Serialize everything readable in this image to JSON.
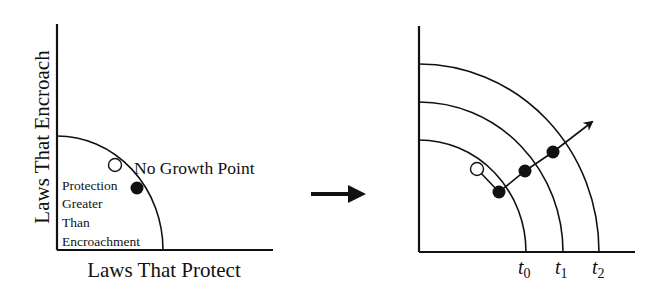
{
  "left_panel": {
    "y_axis_label": "Laws That Encroach",
    "x_axis_label": "Laws That Protect",
    "point_label": "No Growth Point",
    "region_label_lines": [
      "Protection",
      "Greater",
      "Than",
      "Encroachment"
    ],
    "points": [
      {
        "type": "open",
        "name": "no-growth-point"
      },
      {
        "type": "filled",
        "name": "protection-greater-point"
      }
    ]
  },
  "transition_arrow": {
    "direction": "right"
  },
  "right_panel": {
    "curve_labels": [
      {
        "base": "t",
        "sub": "0"
      },
      {
        "base": "t",
        "sub": "1"
      },
      {
        "base": "t",
        "sub": "2"
      }
    ],
    "points": [
      {
        "type": "open"
      },
      {
        "type": "filled",
        "curve": "t0"
      },
      {
        "type": "filled",
        "curve": "t1"
      },
      {
        "type": "filled",
        "curve": "t2"
      }
    ],
    "growth_arrow": "outward"
  },
  "colors": {
    "ink": "#111111",
    "background": "#ffffff"
  }
}
